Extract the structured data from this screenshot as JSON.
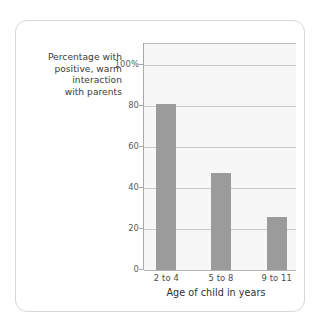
{
  "chart_data": {
    "type": "bar",
    "title": "",
    "subtitle": "",
    "categories": [
      "2 to 4",
      "5 to 8",
      "9 to 11"
    ],
    "values": [
      81,
      47,
      26
    ],
    "xlabel": "Age of child in years",
    "ylabel": "Percentage with positive, warm interaction with parents",
    "ylabel_lines": [
      "Percentage with",
      "positive, warm",
      "interaction",
      "with parents"
    ],
    "ylim": [
      0,
      110
    ],
    "yticks": [
      0,
      20,
      40,
      60,
      80,
      100
    ],
    "ytick_labels": [
      "0",
      "20",
      "40",
      "60",
      "80",
      "100%"
    ],
    "grid": true,
    "grid_axis": "y",
    "legend": false,
    "legend_position": "none",
    "bar_color": "#9b9b9b",
    "plot_background": "#f7f7f7",
    "gridline_color": "#c9c9c9",
    "axis_color": "#a8a8a8",
    "card_border_color": "#d6d6d6"
  }
}
